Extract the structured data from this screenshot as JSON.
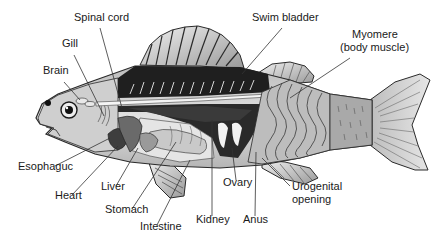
{
  "diagram": {
    "labels": [
      {
        "id": "spinal-cord",
        "text": "Spinal cord",
        "x": 74,
        "y": 17
      },
      {
        "id": "gill",
        "text": "Gill",
        "x": 62,
        "y": 43
      },
      {
        "id": "brain",
        "text": "Brain",
        "x": 43,
        "y": 70
      },
      {
        "id": "swim-bladder",
        "text": "Swim bladder",
        "x": 252,
        "y": 17
      },
      {
        "id": "myomere",
        "text": "Myomere",
        "x": 352,
        "y": 34
      },
      {
        "id": "myomere-sub",
        "text": "(body muscle)",
        "x": 340,
        "y": 47
      },
      {
        "id": "esophagus",
        "text": "Esophaguc",
        "x": 18,
        "y": 166
      },
      {
        "id": "heart",
        "text": "Heart",
        "x": 55,
        "y": 195
      },
      {
        "id": "liver",
        "text": "Liver",
        "x": 101,
        "y": 186
      },
      {
        "id": "stomach",
        "text": "Stomach",
        "x": 105,
        "y": 209
      },
      {
        "id": "intestine",
        "text": "Intestine",
        "x": 140,
        "y": 226
      },
      {
        "id": "kidney",
        "text": "Kidney",
        "x": 196,
        "y": 219
      },
      {
        "id": "ovary",
        "text": "Ovary",
        "x": 223,
        "y": 182
      },
      {
        "id": "anus",
        "text": "Anus",
        "x": 243,
        "y": 219
      },
      {
        "id": "urogenital",
        "text": "Urogenital",
        "x": 292,
        "y": 186
      },
      {
        "id": "urogenital-sub",
        "text": "opening",
        "x": 292,
        "y": 199
      }
    ],
    "colors": {
      "outline": "#2a2a2a",
      "body_light": "#d6d6d6",
      "body_mid": "#a8a8a8",
      "dark_muscle": "#1e1e1e",
      "organ_dark": "#5a5a5a",
      "line": "#333333"
    }
  }
}
